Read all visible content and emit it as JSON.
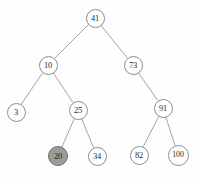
{
  "figure": {
    "name": "binary-search-tree-diagram",
    "background_color": "#fefefe",
    "width": 200,
    "height": 179
  },
  "style": {
    "node_fill": "#ffffff",
    "node_stroke": "#8d8d8d",
    "highlight_fill": "#9c9c9c",
    "highlight_stroke": "#6f6f6f",
    "edge_color": "#9a9a9a",
    "text_color": "#2a2a2a"
  },
  "chart_data": {
    "type": "diagram",
    "diagram_type": "binary-search-tree",
    "title": "",
    "highlighted_nodes": [
      "20"
    ],
    "nodes": [
      {
        "id": "n41",
        "label": "41",
        "x": 95,
        "y": 18,
        "r": 9.5,
        "font_size": 8.5,
        "level": 0,
        "highlighted": false
      },
      {
        "id": "n10",
        "label": "10",
        "x": 48,
        "y": 65,
        "r": 9.5,
        "font_size": 8.5,
        "level": 1,
        "highlighted": false
      },
      {
        "id": "n73",
        "label": "73",
        "x": 133,
        "y": 65,
        "r": 9.5,
        "font_size": 8.5,
        "level": 1,
        "highlighted": false
      },
      {
        "id": "n3",
        "label": "3",
        "x": 16,
        "y": 112,
        "r": 9.5,
        "font_size": 8.5,
        "level": 2,
        "highlighted": false
      },
      {
        "id": "n25",
        "label": "25",
        "x": 78,
        "y": 110,
        "r": 9.5,
        "font_size": 8.5,
        "level": 2,
        "highlighted": false
      },
      {
        "id": "n91",
        "label": "91",
        "x": 163,
        "y": 108,
        "r": 9.5,
        "font_size": 8.5,
        "level": 2,
        "highlighted": false
      },
      {
        "id": "n20",
        "label": "20",
        "x": 58,
        "y": 156,
        "r": 10.0,
        "font_size": 8.5,
        "level": 3,
        "highlighted": true
      },
      {
        "id": "n34",
        "label": "34",
        "x": 97,
        "y": 156,
        "r": 9.5,
        "font_size": 8.5,
        "level": 3,
        "highlighted": false
      },
      {
        "id": "n82",
        "label": "82",
        "x": 139,
        "y": 155,
        "r": 9.5,
        "font_size": 8.5,
        "level": 3,
        "highlighted": false
      },
      {
        "id": "n100",
        "label": "100",
        "x": 178,
        "y": 155,
        "r": 10.5,
        "font_size": 8.0,
        "level": 3,
        "highlighted": false
      }
    ],
    "edges": [
      {
        "from": "n41",
        "to": "n10",
        "side": "left"
      },
      {
        "from": "n41",
        "to": "n73",
        "side": "right"
      },
      {
        "from": "n10",
        "to": "n3",
        "side": "left"
      },
      {
        "from": "n10",
        "to": "n25",
        "side": "right"
      },
      {
        "from": "n73",
        "to": "n91",
        "side": "right"
      },
      {
        "from": "n25",
        "to": "n20",
        "side": "left"
      },
      {
        "from": "n25",
        "to": "n34",
        "side": "right"
      },
      {
        "from": "n91",
        "to": "n82",
        "side": "left"
      },
      {
        "from": "n91",
        "to": "n100",
        "side": "right"
      }
    ]
  }
}
